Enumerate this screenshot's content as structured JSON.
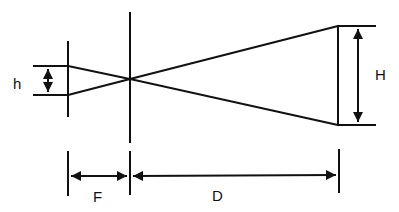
{
  "diagram": {
    "labels": {
      "small_height": "h",
      "large_height": "H",
      "focal_distance": "F",
      "distance": "D"
    },
    "line_color": "#111111",
    "background": "#ffffff"
  }
}
